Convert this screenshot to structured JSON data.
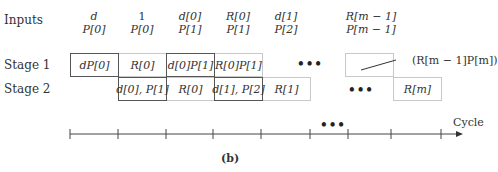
{
  "row_labels": {
    "inputs": "Inputs",
    "stage1": "Stage 1",
    "stage2": "Stage 2"
  },
  "inputs": [
    {
      "top": "d",
      "bottom": "P[0]"
    },
    {
      "top": "1",
      "bottom": "P[0]"
    },
    {
      "top": "d[0]",
      "bottom": "P[1]"
    },
    {
      "top": "R[0]",
      "bottom": "P[1]"
    },
    {
      "top": "d[1]",
      "bottom": "P[2]"
    },
    {
      "top": "R[m − 1]",
      "bottom": "P[m − 1]"
    }
  ],
  "stage1": [
    {
      "label": "dP[0]",
      "emphasis": true
    },
    {
      "label": "R[0]",
      "emphasis": false
    },
    {
      "label": "d[0]P[1]",
      "emphasis": true
    },
    {
      "label": "R[0]P[1]",
      "emphasis": false
    },
    {
      "label": "",
      "emphasis": false
    }
  ],
  "stage2": [
    {
      "label": "d[0], P[1]",
      "emphasis": true
    },
    {
      "label": "R[0]",
      "emphasis": false
    },
    {
      "label": "d[1], P[2]",
      "emphasis": true
    },
    {
      "label": "R[1]",
      "emphasis": false
    },
    {
      "label": "R[m]",
      "emphasis": false
    }
  ],
  "ellipsis": "•••",
  "annotation": "(R[m − 1]P[m])",
  "axis": {
    "label": "Cycle",
    "tick_count": 9
  },
  "caption": "(b)"
}
